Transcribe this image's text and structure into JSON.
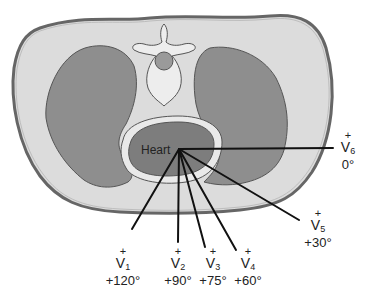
{
  "diagram": {
    "colors": {
      "body_fill": "#dcdcdc",
      "skin_stroke": "#666666",
      "lung_fill": "#8e8e8e",
      "heart_fill": "#7d7d7d",
      "vertebra_fill": "#ededed",
      "spinal_cord_fill": "#9a9a9a",
      "lead_line": "#111111"
    },
    "heart_label": "Heart",
    "leads": [
      {
        "name": "V",
        "sub": "1",
        "sign": "+",
        "angle": "+120°"
      },
      {
        "name": "V",
        "sub": "2",
        "sign": "+",
        "angle": "+90°"
      },
      {
        "name": "V",
        "sub": "3",
        "sign": "+",
        "angle": "+75°"
      },
      {
        "name": "V",
        "sub": "4",
        "sign": "+",
        "angle": "+60°"
      },
      {
        "name": "V",
        "sub": "5",
        "sign": "+",
        "angle": "+30°"
      },
      {
        "name": "V",
        "sub": "6",
        "sign": "+",
        "angle": "0°"
      }
    ]
  }
}
